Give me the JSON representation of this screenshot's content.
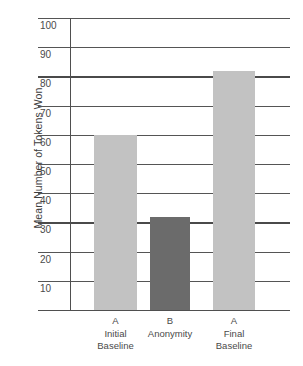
{
  "chart_data": {
    "type": "bar",
    "title": "",
    "xlabel": "",
    "ylabel": "Mean Number of Tokens Won",
    "ylim": [
      0,
      105
    ],
    "ytick_values": [
      10,
      20,
      30,
      40,
      50,
      60,
      70,
      80,
      90,
      100
    ],
    "ytick_labels": [
      "10",
      "20",
      "30",
      "40",
      "50",
      "60",
      "70",
      "80",
      "90",
      "100"
    ],
    "grid": true,
    "legend": "none",
    "categories": [
      "A\nInitial\nBaseline",
      "B\nAnonymity",
      "A\nFinal\nBaseline"
    ],
    "values": [
      60,
      32,
      82
    ],
    "bar_colors": [
      "#c2c2c2",
      "#6b6b6b",
      "#c2c2c2"
    ],
    "bars": [
      {
        "phase": "A",
        "name": "Initial",
        "name2": "Baseline",
        "value": 60,
        "color": "#c2c2c2"
      },
      {
        "phase": "B",
        "name": "Anonymity",
        "name2": "",
        "value": 32,
        "color": "#6b6b6b"
      },
      {
        "phase": "A",
        "name": "Final",
        "name2": "Baseline",
        "value": 82,
        "color": "#c2c2c2"
      }
    ]
  },
  "axis": {
    "y_title": "Mean Number of Tokens Won"
  },
  "colors": {
    "bar_light": "#c2c2c2",
    "bar_dark": "#6b6b6b",
    "grid": "#555555",
    "axis": "#4f4f4f",
    "text": "#4a4a4a",
    "background": "#ffffff"
  }
}
